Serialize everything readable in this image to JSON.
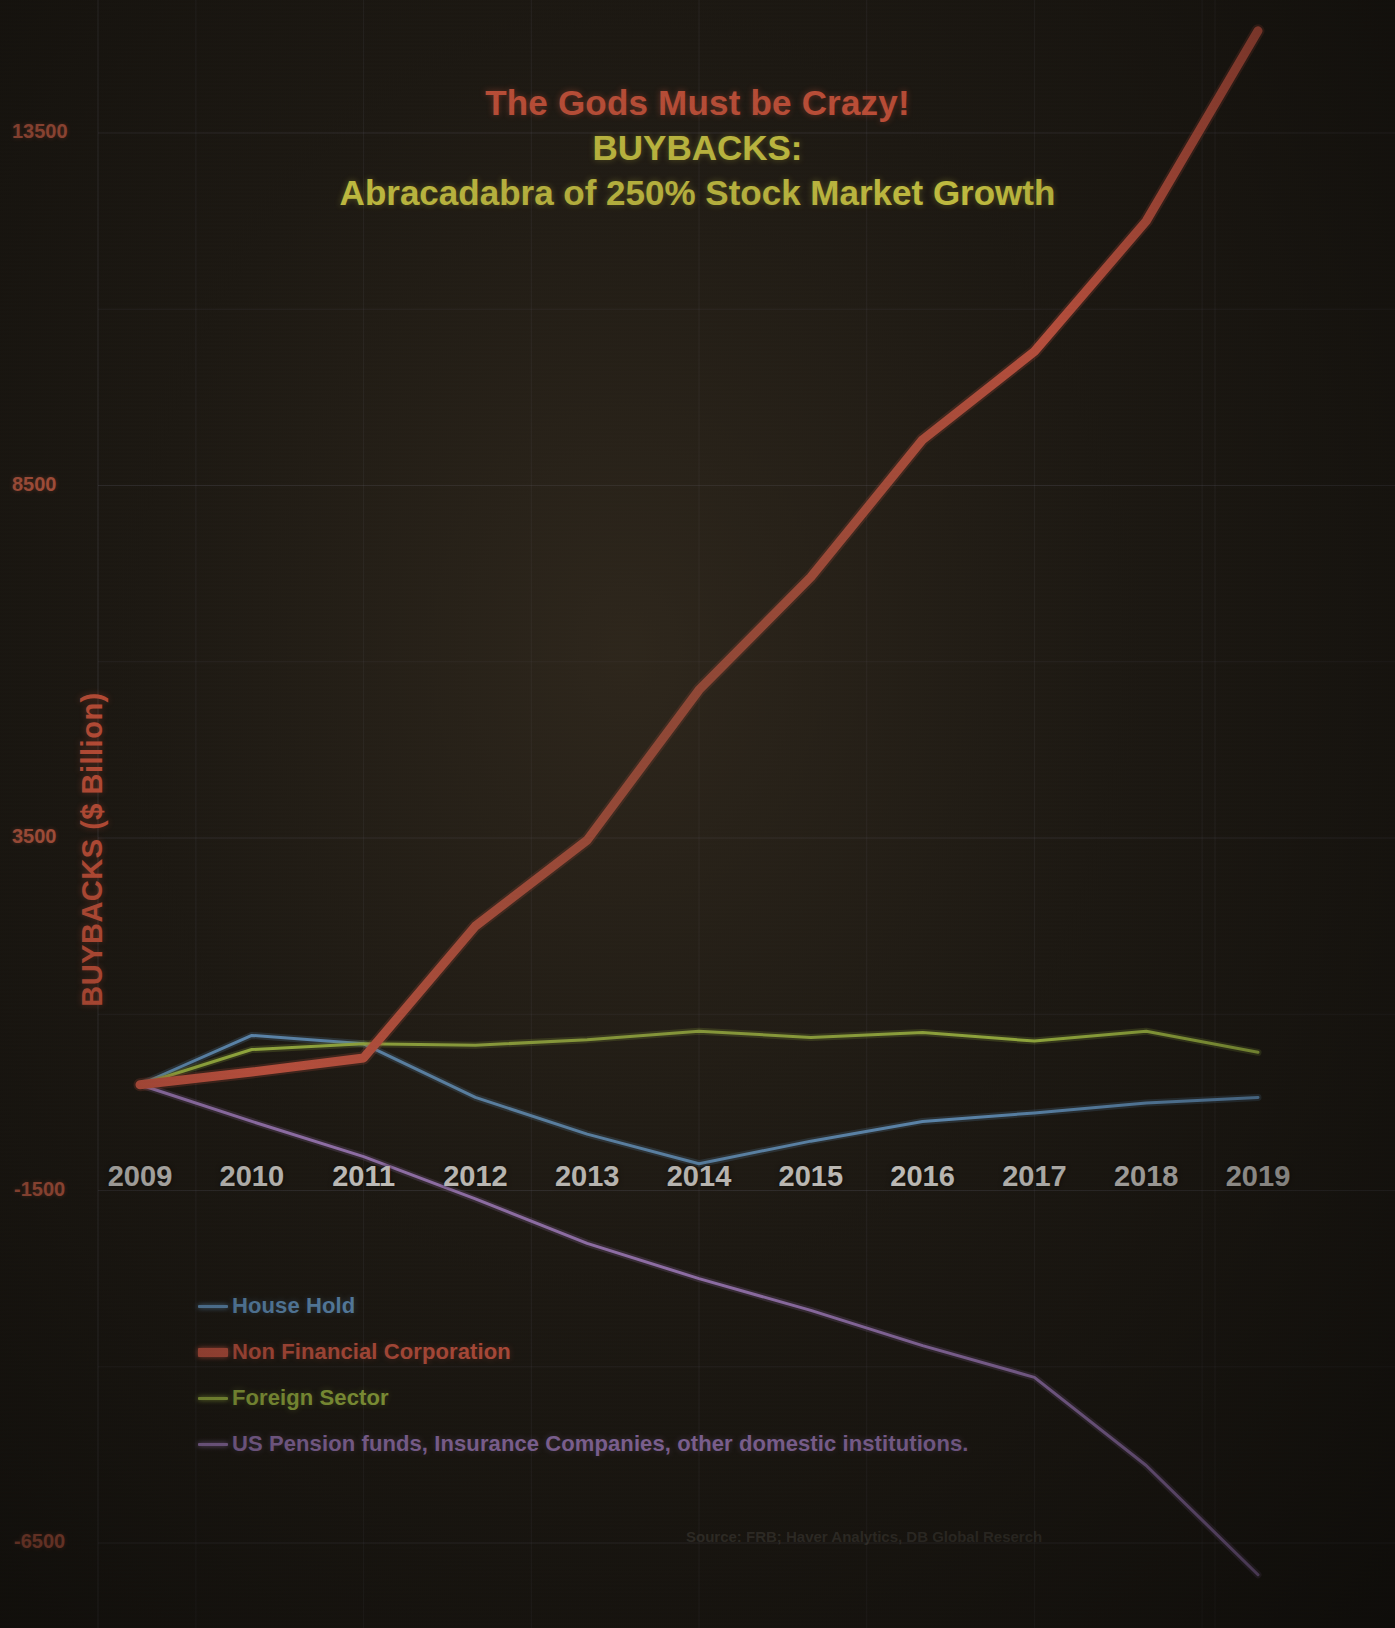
{
  "title": {
    "line1": "The Gods Must be Crazy!",
    "line2": "BUYBACKS:",
    "line3": "Abracadabra of 250% Stock Market Growth",
    "line1_color": "#ef5f43",
    "line2_color": "#f7f24e",
    "line3_color": "#f7f24e"
  },
  "source_note": "Source: FRB; Haver Analytics, DB Global Reserch",
  "legend": {
    "items": [
      {
        "label": "House Hold",
        "color": "#6fa8dc",
        "width": 3
      },
      {
        "label": "Non Financial Corporation",
        "color": "#e8604a",
        "width": 9
      },
      {
        "label": "Foreign Sector",
        "color": "#b6d44a",
        "width": 3
      },
      {
        "label": "US Pension funds, Insurance Companies, other domestic institutions.",
        "color": "#b48ad6",
        "width": 3
      }
    ]
  },
  "chart_data": {
    "type": "line",
    "title": "The Gods Must be Crazy! BUYBACKS: Abracadabra of 250% Stock Market Growth",
    "xlabel": "",
    "ylabel": "BUYBACKS ($ Billion)",
    "x": [
      2009,
      2010,
      2011,
      2012,
      2013,
      2014,
      2015,
      2016,
      2017,
      2018,
      2019
    ],
    "xtick_labels": [
      "2009",
      "2010",
      "2011",
      "2012",
      "2013",
      "2014",
      "2015",
      "2016",
      "2017",
      "2018",
      "2019"
    ],
    "ytick_labels": [
      "13500",
      "8500",
      "3500",
      "-1500",
      "-6500"
    ],
    "yticks": [
      13500,
      8500,
      3500,
      -1500,
      -6500
    ],
    "ylim": [
      -7200,
      15600
    ],
    "xlim": [
      2008.8,
      2019.25
    ],
    "grid": true,
    "legend_position": "lower-left",
    "series": [
      {
        "name": "House Hold",
        "color": "#6fa8dc",
        "values": [
          0,
          700,
          580,
          -180,
          -700,
          -1120,
          -800,
          -520,
          -400,
          -260,
          -180
        ]
      },
      {
        "name": "Non Financial Corporation",
        "color": "#e8604a",
        "values": [
          0,
          180,
          380,
          2250,
          3470,
          5600,
          7200,
          9150,
          10400,
          12250,
          14950
        ]
      },
      {
        "name": "Foreign Sector",
        "color": "#b6d44a",
        "values": [
          0,
          500,
          580,
          560,
          640,
          760,
          670,
          740,
          620,
          760,
          460
        ]
      },
      {
        "name": "US Pension funds, Insurance Companies, other domestic institutions.",
        "color": "#b48ad6",
        "values": [
          0,
          -520,
          -1020,
          -1620,
          -2250,
          -2750,
          -3200,
          -3700,
          -4150,
          -5400,
          -6950
        ]
      }
    ]
  }
}
